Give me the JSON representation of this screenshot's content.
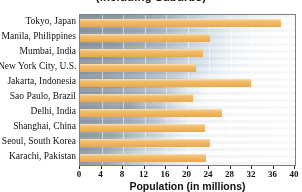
{
  "chart_data": {
    "type": "bar",
    "orientation": "horizontal",
    "title": "(including Suburbs)",
    "xlabel": "Population (in millions)",
    "ylabel": "",
    "xlim": [
      0,
      40
    ],
    "xticks": [
      0,
      4,
      8,
      12,
      16,
      20,
      24,
      28,
      32,
      36,
      40
    ],
    "grid": true,
    "grid_axis": "x",
    "legend": null,
    "bar_color": "#eeb25a",
    "categories": [
      "Tokyo, Japan",
      "Manila, Philippines",
      "Mumbai, India",
      "New York City, U.S.",
      "Jakarta, Indonesia",
      "Sao Paulo, Brazil",
      "Delhi, India",
      "Shanghai, China",
      "Seoul, South Korea",
      "Karachi, Pakistan"
    ],
    "values": [
      37.4,
      24.2,
      22.9,
      21.6,
      31.8,
      21.0,
      26.4,
      23.3,
      24.2,
      23.4
    ]
  }
}
